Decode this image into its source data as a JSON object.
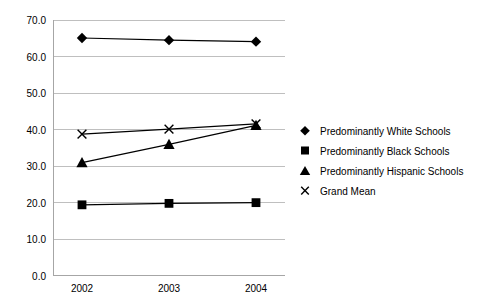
{
  "chart_data": {
    "type": "line",
    "title": "",
    "subtitle": "",
    "xlabel": "",
    "ylabel": "",
    "categories": [
      "2002",
      "2003",
      "2004"
    ],
    "x": [
      2002,
      2003,
      2004
    ],
    "ylim": [
      0.0,
      70.0
    ],
    "ytick_step": 10.0,
    "ytick_labels": [
      "0.0",
      "10.0",
      "20.0",
      "30.0",
      "40.0",
      "50.0",
      "60.0",
      "70.0"
    ],
    "ytick_values": [
      0.0,
      10.0,
      20.0,
      30.0,
      40.0,
      50.0,
      60.0,
      70.0
    ],
    "xtick_labels": [
      "2002",
      "2003",
      "2004"
    ],
    "grid": "horizontal",
    "legend_position": "right",
    "series": [
      {
        "name": "Predominantly White Schools",
        "marker": "diamond",
        "values": [
          65.2,
          64.6,
          64.2
        ]
      },
      {
        "name": "Predominantly Black Schools",
        "marker": "square",
        "values": [
          19.4,
          19.8,
          20.0
        ]
      },
      {
        "name": "Predominantly Hispanic Schools",
        "marker": "triangle",
        "values": [
          31.0,
          36.0,
          41.2
        ]
      },
      {
        "name": "Grand Mean",
        "marker": "x",
        "values": [
          38.8,
          40.2,
          41.6
        ]
      }
    ],
    "colors": {
      "series_line": "#000000",
      "marker": "#000000",
      "gridline": "#bfbfbf",
      "axis": "#a6a6a6",
      "background": "#ffffff",
      "text": "#000000"
    }
  },
  "legend": {
    "items": [
      {
        "label": "Predominantly White Schools",
        "marker": "diamond-marker-icon"
      },
      {
        "label": "Predominantly Black Schools",
        "marker": "square-marker-icon"
      },
      {
        "label": "Predominantly Hispanic Schools",
        "marker": "triangle-marker-icon"
      },
      {
        "label": "Grand Mean",
        "marker": "x-marker-icon"
      }
    ]
  },
  "axes": {
    "y_ticks": [
      "70.0",
      "60.0",
      "50.0",
      "40.0",
      "30.0",
      "20.0",
      "10.0",
      "0.0"
    ],
    "x_ticks": [
      "2002",
      "2003",
      "2004"
    ]
  }
}
